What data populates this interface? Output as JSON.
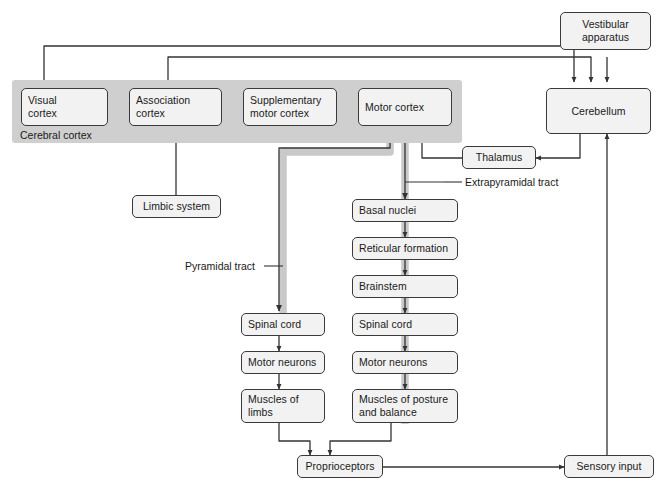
{
  "diagram": {
    "band": {
      "label": "Cerebral cortex",
      "color": "#cfcfcf"
    },
    "colors": {
      "node_fill": "#f2f2f2",
      "node_stroke": "#3a3a3a",
      "tract_band": "#c9c9c9",
      "connector": "#333333"
    },
    "nodes": {
      "visual_cortex": "Visual\ncortex",
      "association_cortex": "Association\ncortex",
      "supplementary_motor_cortex": "Supplementary\nmotor cortex",
      "motor_cortex": "Motor cortex",
      "vestibular_apparatus": "Vestibular\napparatus",
      "cerebellum": "Cerebellum",
      "thalamus": "Thalamus",
      "limbic_system": "Limbic system",
      "basal_nuclei": "Basal nuclei",
      "reticular_formation": "Reticular formation",
      "brainstem": "Brainstem",
      "spinal_cord_mid": "Spinal cord",
      "motor_neurons_mid": "Motor neurons",
      "muscles_posture": "Muscles of posture\nand balance",
      "spinal_cord_left": "Spinal cord",
      "motor_neurons_left": "Motor neurons",
      "muscles_limbs": "Muscles of\nlimbs",
      "proprioceptors": "Proprioceptors",
      "sensory_input": "Sensory input"
    },
    "tract_labels": {
      "pyramidal": "Pyramidal tract",
      "extrapyramidal": "Extrapyramidal tract"
    }
  }
}
